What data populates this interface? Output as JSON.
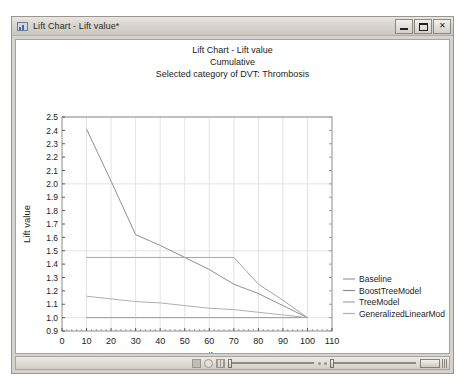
{
  "window": {
    "title": "Lift Chart - Lift value*",
    "icon": "chart-window-icon",
    "minimize_label": "Minimize",
    "maximize_label": "Maximize",
    "close_label": "✕"
  },
  "chart_data": {
    "type": "line",
    "title": "Lift Chart - Lift value",
    "subtitle": "Cumulative",
    "subtitle2": "Selected category of DVT: Thrombosis",
    "xlabel": "Percentile",
    "ylabel": "Lift value",
    "xlim": [
      0,
      110
    ],
    "ylim": [
      0.9,
      2.5
    ],
    "xticks": [
      0,
      10,
      20,
      30,
      40,
      50,
      60,
      70,
      80,
      90,
      100,
      110
    ],
    "yticks": [
      0.9,
      1.0,
      1.1,
      1.2,
      1.3,
      1.4,
      1.5,
      1.6,
      1.7,
      1.8,
      1.9,
      2.0,
      2.1,
      2.2,
      2.3,
      2.4,
      2.5
    ],
    "grid": true,
    "legend_position": "right",
    "series": [
      {
        "name": "Baseline",
        "color": "#9a9a9a",
        "x": [
          10,
          20,
          30,
          40,
          50,
          60,
          70,
          80,
          90,
          100
        ],
        "values": [
          1.0,
          1.0,
          1.0,
          1.0,
          1.0,
          1.0,
          1.0,
          1.0,
          1.0,
          1.0
        ]
      },
      {
        "name": "BoostTreeModel",
        "color": "#8f8f8f",
        "x": [
          10,
          20,
          30,
          40,
          50,
          60,
          70,
          80,
          90,
          100
        ],
        "values": [
          2.41,
          2.02,
          1.62,
          1.54,
          1.45,
          1.36,
          1.25,
          1.18,
          1.09,
          1.0
        ]
      },
      {
        "name": "TreeModel",
        "color": "#a6a6a6",
        "x": [
          10,
          20,
          30,
          40,
          50,
          60,
          70,
          80,
          90,
          100
        ],
        "values": [
          1.45,
          1.45,
          1.45,
          1.45,
          1.45,
          1.45,
          1.45,
          1.25,
          1.13,
          1.0
        ]
      },
      {
        "name": "GeneralizedLinearMod",
        "color": "#b0b0b0",
        "x": [
          10,
          20,
          30,
          40,
          50,
          60,
          70,
          80,
          90,
          100
        ],
        "values": [
          1.16,
          1.14,
          1.12,
          1.11,
          1.09,
          1.07,
          1.06,
          1.04,
          1.02,
          1.0
        ]
      }
    ],
    "legend": [
      {
        "label": "Baseline",
        "color": "#9a9a9a"
      },
      {
        "label": "BoostTreeModel",
        "color": "#8f8f8f"
      },
      {
        "label": "TreeModel",
        "color": "#a6a6a6"
      },
      {
        "label": "GeneralizedLinearMod",
        "color": "#b0b0b0"
      }
    ]
  }
}
